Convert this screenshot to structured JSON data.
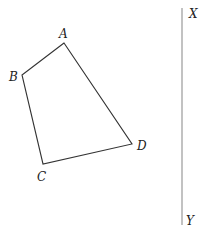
{
  "diagram": {
    "quadrilateral": {
      "vertices": [
        {
          "label": "A",
          "x": 64,
          "y": 43
        },
        {
          "label": "B",
          "x": 22,
          "y": 75
        },
        {
          "label": "C",
          "x": 43,
          "y": 164
        },
        {
          "label": "D",
          "x": 132,
          "y": 144
        }
      ],
      "stroke": "#333333"
    },
    "line": {
      "start_label": "X",
      "end_label": "Y",
      "x": 182,
      "y1": 8,
      "y2": 225,
      "stroke": "#999999"
    },
    "labels": {
      "A": "A",
      "B": "B",
      "C": "C",
      "D": "D",
      "X": "X",
      "Y": "Y"
    }
  }
}
